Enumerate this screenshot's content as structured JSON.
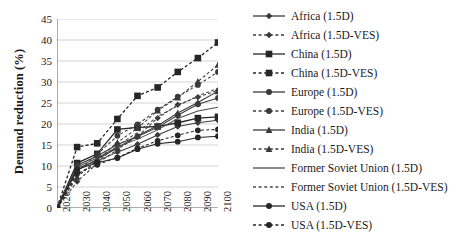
{
  "chart_data": {
    "type": "line",
    "title": "",
    "xlabel": "",
    "ylabel": "Demand reduction (%)",
    "x": [
      2020,
      2030,
      2040,
      2050,
      2060,
      2070,
      2080,
      2090,
      2100
    ],
    "xlim": [
      2020,
      2100
    ],
    "ylim": [
      0,
      45
    ],
    "ytick_values": [
      0,
      5,
      10,
      15,
      20,
      25,
      30,
      35,
      40,
      45
    ],
    "xtick_labels": [
      "2020",
      "2030",
      "2040",
      "2050",
      "2060",
      "2070",
      "2080",
      "2090",
      "2100"
    ],
    "ytick_labels": [
      "0",
      "5",
      "10",
      "15",
      "20",
      "25",
      "30",
      "35",
      "40",
      "45"
    ],
    "grid": "horizontal",
    "legend_position": "right",
    "series": [
      {
        "name": "Africa (1.5D)",
        "label": "Africa (1.5D)",
        "marker": "diamond",
        "linestyle": "solid",
        "color": "#3a3a3a",
        "values": [
          0,
          9.5,
          11.2,
          13.3,
          15.2,
          17.4,
          19.4,
          20.3,
          20.9
        ]
      },
      {
        "name": "Africa (1.5D-VES)",
        "label": "Africa (1.5D-VES)",
        "marker": "diamond",
        "linestyle": "dashed",
        "color": "#3a3a3a",
        "values": [
          0,
          6.3,
          10.6,
          13.9,
          17.1,
          21.4,
          24.6,
          26.4,
          28.0
        ]
      },
      {
        "name": "China (1.5D)",
        "label": "China (1.5D)",
        "marker": "square",
        "linestyle": "solid",
        "color": "#262626",
        "values": [
          0,
          10.7,
          12.9,
          18.7,
          19.2,
          19.4,
          20.3,
          21.4,
          21.7
        ]
      },
      {
        "name": "China (1.5D-VES)",
        "label": "China (1.5D-VES)",
        "marker": "square",
        "linestyle": "dashed",
        "color": "#262626",
        "values": [
          0,
          14.5,
          15.4,
          21.2,
          26.7,
          28.7,
          32.4,
          35.7,
          39.4
        ]
      },
      {
        "name": "Europe (1.5D)",
        "label": "Europe (1.5D)",
        "marker": "circle",
        "linestyle": "solid",
        "color": "#3a3a3a",
        "values": [
          0,
          10.2,
          12.4,
          15.1,
          17.0,
          19.2,
          22.1,
          24.7,
          26.2
        ]
      },
      {
        "name": "Europe (1.5D-VES)",
        "label": "Europe (1.5D-VES)",
        "marker": "circle",
        "linestyle": "dashed",
        "color": "#3a3a3a",
        "values": [
          0,
          8.6,
          12.8,
          17.2,
          19.9,
          23.4,
          26.5,
          29.3,
          32.4
        ]
      },
      {
        "name": "India (1.5D)",
        "label": "India (1.5D)",
        "marker": "triangle",
        "linestyle": "solid",
        "color": "#3a3a3a",
        "values": [
          0,
          9.0,
          11.6,
          14.3,
          17.2,
          19.6,
          22.6,
          25.1,
          27.8
        ]
      },
      {
        "name": "India (1.5D-VES)",
        "label": "India (1.5D-VES)",
        "marker": "triangle",
        "linestyle": "dashed",
        "color": "#3a3a3a",
        "values": [
          0,
          7.4,
          11.4,
          15.6,
          19.0,
          23.2,
          26.3,
          30.1,
          34.1
        ]
      },
      {
        "name": "Former Soviet Union (1.5D)",
        "label": "Former Soviet Union (1.5D)",
        "marker": "none",
        "linestyle": "solid",
        "color": "#4a4a4a",
        "values": [
          0,
          9.8,
          11.9,
          14.5,
          16.4,
          18.6,
          21.3,
          23.1,
          24.0
        ]
      },
      {
        "name": "Former Soviet Union (1.5D-VES)",
        "label": "Former Soviet Union (1.5D-VES)",
        "marker": "none",
        "linestyle": "dashed",
        "color": "#4a4a4a",
        "values": [
          0,
          7.9,
          11.0,
          14.8,
          18.0,
          21.8,
          24.3,
          26.7,
          28.5
        ]
      },
      {
        "name": "USA (1.5D)",
        "label": "USA (1.5D)",
        "marker": "circle",
        "linestyle": "solid",
        "color": "#262626",
        "values": [
          0,
          9.2,
          10.8,
          11.9,
          14.0,
          15.3,
          15.8,
          16.8,
          17.1
        ]
      },
      {
        "name": "USA (1.5D-VES)",
        "label": "USA (1.5D-VES)",
        "marker": "circle",
        "linestyle": "dashed",
        "color": "#262626",
        "values": [
          0,
          8.2,
          10.3,
          12.0,
          14.2,
          16.0,
          17.3,
          18.5,
          18.7
        ]
      }
    ]
  },
  "axes": {
    "y_title": "Demand reduction (%)"
  }
}
